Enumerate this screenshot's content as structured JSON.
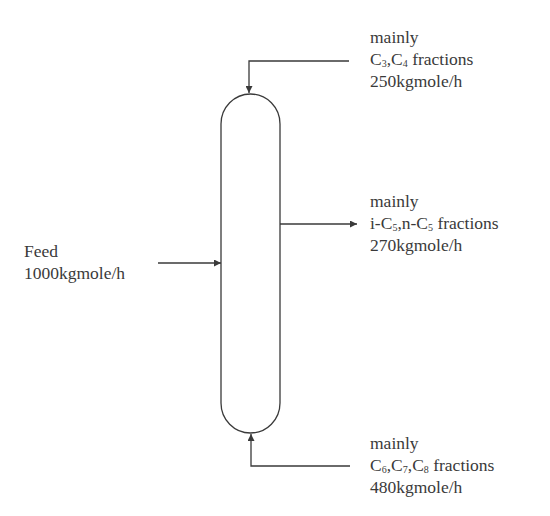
{
  "diagram": {
    "type": "distillation-column",
    "colors": {
      "stroke": "#3a3a3a",
      "background": "#ffffff",
      "text": "#3a3a3a"
    },
    "feed": {
      "line1": "Feed",
      "line2": "1000kgmole/h"
    },
    "top_stream": {
      "line1": "mainly",
      "line2_parts": [
        {
          "text": "C"
        },
        {
          "sub": "3"
        },
        {
          "text": ",C"
        },
        {
          "sub": "4"
        },
        {
          "text": " fractions"
        }
      ],
      "line2_plain": "C3,C4 fractions",
      "line3": "250kgmole/h"
    },
    "side_stream": {
      "line1": "mainly",
      "line2_parts": [
        {
          "text": "i-C"
        },
        {
          "sub": "5"
        },
        {
          "text": ",n-C"
        },
        {
          "sub": "5"
        },
        {
          "text": " fractions"
        }
      ],
      "line2_plain": "i-C5,n-C5 fractions",
      "line3": "270kgmole/h"
    },
    "bottom_stream": {
      "line1": "mainly",
      "line2_parts": [
        {
          "text": "C"
        },
        {
          "sub": "6"
        },
        {
          "text": ",C"
        },
        {
          "sub": "7"
        },
        {
          "text": ",C"
        },
        {
          "sub": "8"
        },
        {
          "text": " fractions"
        }
      ],
      "line2_plain": "C6,C7,C8 fractions",
      "line3": "480kgmole/h"
    }
  }
}
